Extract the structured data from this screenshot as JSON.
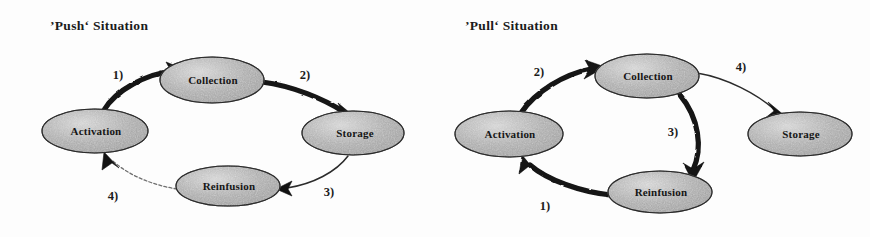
{
  "figure": {
    "caption_absent": true,
    "panels": [
      {
        "id": "push",
        "title": "’Push‘ Situation",
        "nodes": [
          {
            "id": "collection",
            "label": "Collection",
            "cx": 212,
            "cy": 80,
            "rx": 52,
            "ry": 23
          },
          {
            "id": "storage",
            "label": "Storage",
            "cx": 353,
            "cy": 133,
            "rx": 51,
            "ry": 22
          },
          {
            "id": "reinfusion",
            "label": "Reinfusion",
            "cx": 228,
            "cy": 186,
            "rx": 52,
            "ry": 20
          },
          {
            "id": "activation",
            "label": "Activation",
            "cx": 95,
            "cy": 131,
            "rx": 53,
            "ry": 22
          }
        ],
        "edges": [
          {
            "id": "e1",
            "label": "1)",
            "from": "activation",
            "to": "collection",
            "weight": "thick",
            "lx": 118,
            "ly": 76
          },
          {
            "id": "e2",
            "label": "2)",
            "from": "collection",
            "to": "storage",
            "weight": "thick",
            "lx": 305,
            "ly": 76
          },
          {
            "id": "e3",
            "label": "3)",
            "from": "storage",
            "to": "reinfusion",
            "weight": "thin",
            "lx": 329,
            "ly": 193
          },
          {
            "id": "e4",
            "label": "4)",
            "from": "reinfusion",
            "to": "activation",
            "weight": "faint",
            "lx": 113,
            "ly": 197
          }
        ]
      },
      {
        "id": "pull",
        "title": "’Pull‘ Situation",
        "nodes": [
          {
            "id": "collection",
            "label": "Collection",
            "cx": 212,
            "cy": 76,
            "rx": 52,
            "ry": 22
          },
          {
            "id": "storage",
            "label": "Storage",
            "cx": 365,
            "cy": 134,
            "rx": 52,
            "ry": 22
          },
          {
            "id": "reinfusion",
            "label": "Reinfusion",
            "cx": 225,
            "cy": 192,
            "rx": 52,
            "ry": 21
          },
          {
            "id": "activation",
            "label": "Activation",
            "cx": 74,
            "cy": 134,
            "rx": 54,
            "ry": 23
          }
        ],
        "edges": [
          {
            "id": "e2",
            "label": "2)",
            "from": "activation",
            "to": "collection",
            "weight": "thick",
            "lx": 104,
            "ly": 73
          },
          {
            "id": "e4",
            "label": "4)",
            "from": "collection",
            "to": "storage",
            "weight": "thin",
            "lx": 306,
            "ly": 68
          },
          {
            "id": "e3",
            "label": "3)",
            "from": "collection",
            "to": "reinfusion",
            "weight": "thick",
            "lx": 238,
            "ly": 133
          },
          {
            "id": "e1",
            "label": "1)",
            "from": "reinfusion",
            "to": "activation",
            "weight": "thick",
            "lx": 110,
            "ly": 207
          }
        ]
      }
    ],
    "colors": {
      "node_fill": "#a8a8a8",
      "node_fill_light": "#cfcfcf",
      "node_stroke": "#2a2a2a",
      "arrow_dark": "#141414",
      "arrow_thin": "#2b2b2b",
      "arrow_faint": "#6f6f6f",
      "text": "#161616",
      "background": "#fdfdfd"
    }
  }
}
